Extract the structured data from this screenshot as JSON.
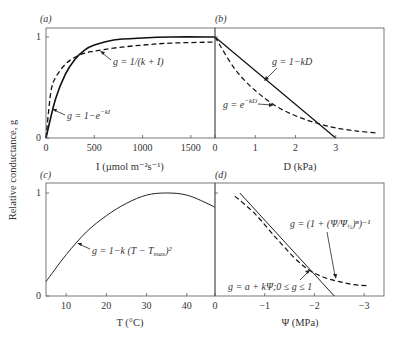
{
  "ylabel": "Relative conductance, g",
  "chart_data": [
    {
      "panel": "(a)",
      "type": "line",
      "xlabel": "I (µmol m⁻²s⁻¹)",
      "ylabel": "Relative conductance, g",
      "xlim": [
        0,
        1750
      ],
      "ylim": [
        0,
        1.1
      ],
      "xticks": [
        0,
        500,
        1000,
        1500
      ],
      "yticks": [
        0,
        1
      ],
      "series": [
        {
          "name": "g = 1−e^(−kI)",
          "style": "solid",
          "x": [
            0,
            100,
            200,
            300,
            400,
            500,
            700,
            1000,
            1300,
            1750
          ],
          "values": [
            0,
            0.39,
            0.63,
            0.78,
            0.87,
            0.92,
            0.97,
            0.99,
            1.0,
            1.0
          ]
        },
        {
          "name": "g = I/(k + I)",
          "style": "dashed",
          "x": [
            0,
            50,
            100,
            200,
            300,
            400,
            500,
            700,
            1000,
            1300,
            1750
          ],
          "values": [
            0,
            0.45,
            0.6,
            0.73,
            0.8,
            0.84,
            0.86,
            0.89,
            0.92,
            0.94,
            0.95
          ]
        }
      ]
    },
    {
      "panel": "(b)",
      "type": "line",
      "xlabel": "D (kPa)",
      "xlim": [
        0,
        4.2
      ],
      "ylim": [
        0,
        1.1
      ],
      "xticks": [
        0,
        1,
        2,
        3
      ],
      "series": [
        {
          "name": "g = 1−kD",
          "style": "solid",
          "x": [
            0,
            3
          ],
          "values": [
            1,
            0
          ]
        },
        {
          "name": "g = e^(−kD)",
          "style": "dashed",
          "x": [
            0,
            0.5,
            1,
            1.5,
            2,
            2.5,
            3,
            3.5,
            4
          ],
          "values": [
            1,
            0.68,
            0.47,
            0.32,
            0.22,
            0.15,
            0.1,
            0.07,
            0.05
          ]
        }
      ]
    },
    {
      "panel": "(c)",
      "type": "line",
      "xlabel": "T (°C)",
      "xlim": [
        5,
        47
      ],
      "ylim": [
        0,
        1.1
      ],
      "xticks": [
        10,
        20,
        30,
        40
      ],
      "yticks": [
        0,
        1
      ],
      "series": [
        {
          "name": "g = 1−k(T−Tmax)²",
          "style": "solid",
          "x": [
            5,
            10,
            15,
            20,
            25,
            30,
            35,
            40,
            45,
            47
          ],
          "values": [
            0.14,
            0.4,
            0.62,
            0.78,
            0.9,
            0.98,
            1.0,
            0.98,
            0.9,
            0.86
          ]
        }
      ]
    },
    {
      "panel": "(d)",
      "type": "line",
      "xlabel": "Ψ (MPa)",
      "xlim": [
        0,
        -3.4
      ],
      "ylim": [
        0,
        1.1
      ],
      "xticks": [
        0,
        -1,
        -2,
        -3
      ],
      "series": [
        {
          "name": "g = a + kΨ; 0 ≤ g ≤ 1",
          "style": "solid",
          "x": [
            -0.5,
            -2.4
          ],
          "values": [
            1.0,
            0
          ]
        },
        {
          "name": "g = (1 + (Ψ/Ψ½)ⁿ)⁻¹",
          "style": "dashed",
          "x": [
            -0.4,
            -0.8,
            -1.2,
            -1.6,
            -1.9,
            -2.2,
            -2.5,
            -2.8,
            -3.1
          ],
          "values": [
            0.97,
            0.8,
            0.58,
            0.37,
            0.25,
            0.18,
            0.14,
            0.11,
            0.1
          ]
        }
      ]
    }
  ],
  "labels": {
    "a": {
      "panel": "(a)",
      "xlabel": "I (µmol m⁻²s⁻¹)",
      "eq1": "g = 1/(k + I)",
      "eq2": "g = 1−e",
      "eq2_sup": "−kI",
      "ticks_x": [
        "0",
        "500",
        "1000",
        "1500"
      ],
      "ticks_y": [
        "0",
        "1"
      ]
    },
    "b": {
      "panel": "(b)",
      "xlabel": "D (kPa)",
      "eq1": "g = 1−kD",
      "eq2": "g = e",
      "eq2_sup": "−kD",
      "ticks_x": [
        "0",
        "1",
        "2",
        "3"
      ]
    },
    "c": {
      "panel": "(c)",
      "xlabel": "T (°C)",
      "eq1": "g = 1−k (T − T",
      "eq1_sub": "max",
      "eq1_end": ")²",
      "ticks_x": [
        "10",
        "20",
        "30",
        "40"
      ],
      "ticks_y": [
        "0",
        "1"
      ]
    },
    "d": {
      "panel": "(d)",
      "xlabel": "Ψ (MPa)",
      "eq1": "g = (1 + (Ψ/Ψ",
      "eq1_sub": "½",
      "eq1_end": ")ⁿ)⁻¹",
      "eq2": "g = a + kΨ;0 ≤ g ≤ 1",
      "ticks_x": [
        "0",
        "−1",
        "−2",
        "−3"
      ]
    }
  }
}
